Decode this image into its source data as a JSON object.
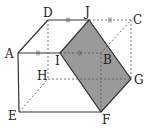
{
  "diagram": {
    "type": "cube-section",
    "colors": {
      "shade": "#9a9a9a",
      "line": "#333333",
      "background": "#ffffff"
    },
    "points": {
      "A": {
        "label": "A",
        "x": 18,
        "y": 53
      },
      "B": {
        "label": "B",
        "x": 101,
        "y": 53
      },
      "C": {
        "label": "C",
        "x": 131,
        "y": 20
      },
      "D": {
        "label": "D",
        "x": 48,
        "y": 20
      },
      "E": {
        "label": "E",
        "x": 19,
        "y": 112
      },
      "F": {
        "label": "F",
        "x": 101,
        "y": 112
      },
      "G": {
        "label": "G",
        "x": 131,
        "y": 79
      },
      "H": {
        "label": "H",
        "x": 48,
        "y": 79
      },
      "I": {
        "label": "I",
        "x": 60,
        "y": 53
      },
      "J": {
        "label": "J",
        "x": 89,
        "y": 20
      }
    },
    "shaded_face": [
      "I",
      "J",
      "G",
      "F"
    ],
    "equal_marks": [
      "AI",
      "IB",
      "DJ",
      "JC"
    ]
  }
}
